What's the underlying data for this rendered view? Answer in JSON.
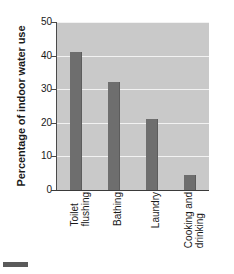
{
  "chart_data": {
    "type": "bar",
    "title": "",
    "subtitle": "",
    "xlabel": "",
    "ylabel": "Percentage of indoor water use",
    "categories": [
      "Toilet flushing",
      "Bathing",
      "Laundry",
      "Cooking and drinking"
    ],
    "category_lines": [
      [
        "Toilet",
        "flushing"
      ],
      [
        "Bathing"
      ],
      [
        "Laundry"
      ],
      [
        "Cooking and",
        "drinking"
      ]
    ],
    "values": [
      41,
      32,
      21,
      4.5
    ],
    "ylim": [
      0,
      50
    ],
    "yticks": [
      0,
      10,
      20,
      30,
      40,
      50
    ],
    "ytick_labels": [
      "0",
      "10",
      "20",
      "30",
      "40",
      "50"
    ],
    "grid": true,
    "grid_orientation": "horizontal",
    "legend": null,
    "legend_position": "none",
    "annotations": [],
    "colors": {
      "bar": "#6e6e6e",
      "plot_background": "#c9c9c9",
      "gridline": "#f2f2f2",
      "axis": "#3a3a3a",
      "text": "#1a1a1a",
      "page_background": "#ffffff",
      "corner_swatch": "#5a5a5a"
    }
  }
}
